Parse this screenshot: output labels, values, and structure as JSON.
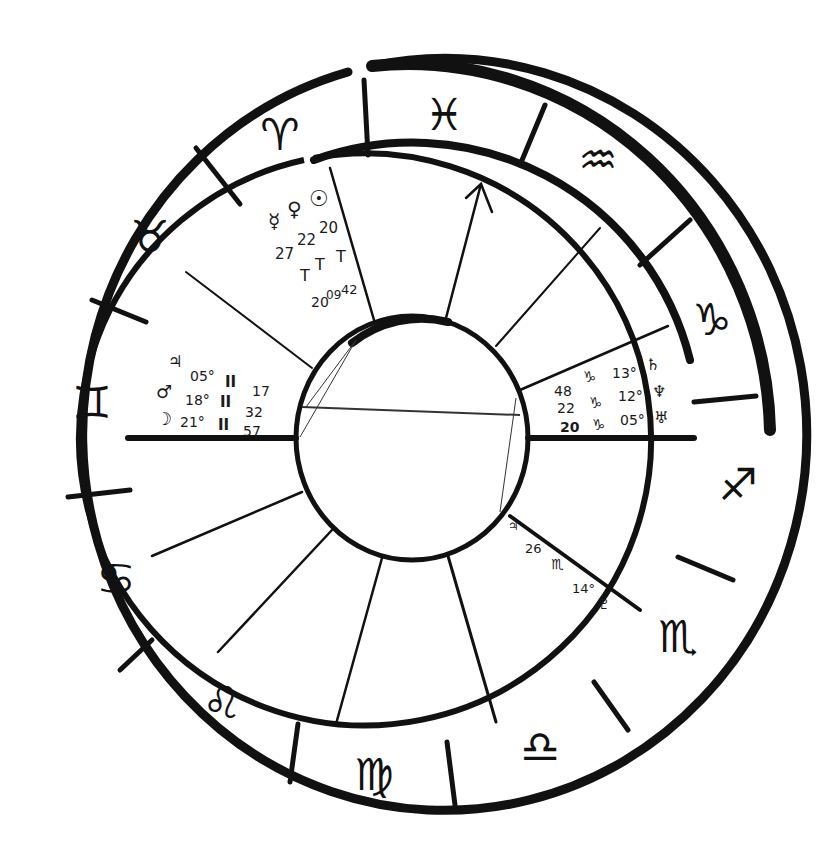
{
  "chart": {
    "type": "natal-chart-wheel",
    "style": "hand-drawn",
    "colors": {
      "ink": "#111111",
      "background": "#ffffff"
    }
  },
  "signs": [
    {
      "name": "pisces",
      "glyph": "♓",
      "x": 444,
      "y": 120,
      "rot": -2
    },
    {
      "name": "aquarius",
      "glyph": "♒",
      "x": 598,
      "y": 165,
      "rot": 25
    },
    {
      "name": "capricorn",
      "glyph": "♑",
      "x": 712,
      "y": 322,
      "rot": 50
    },
    {
      "name": "sagittarius",
      "glyph": "♐",
      "x": 736,
      "y": 490,
      "rot": 0
    },
    {
      "name": "scorpio",
      "glyph": "♏",
      "x": 680,
      "y": 640,
      "rot": -35
    },
    {
      "name": "libra",
      "glyph": "♎",
      "x": 540,
      "y": 752,
      "rot": -10
    },
    {
      "name": "virgo",
      "glyph": "♍",
      "x": 374,
      "y": 776,
      "rot": 0
    },
    {
      "name": "leo",
      "glyph": "♌",
      "x": 222,
      "y": 708,
      "rot": 25
    },
    {
      "name": "cancer",
      "glyph": "♋",
      "x": 116,
      "y": 580,
      "rot": 65
    },
    {
      "name": "gemini",
      "glyph": "♊",
      "x": 90,
      "y": 400,
      "rot": 90
    },
    {
      "name": "taurus",
      "glyph": "♉",
      "x": 150,
      "y": 240,
      "rot": -30
    },
    {
      "name": "aries",
      "glyph": "♈",
      "x": 280,
      "y": 140,
      "rot": -15
    }
  ],
  "planets": {
    "upper_group": {
      "mercury": {
        "glyph": "☿",
        "degree": "27°",
        "sign": "♈",
        "minutes": "20"
      },
      "venus": {
        "glyph": "♀",
        "degree": "22°",
        "sign": "♈",
        "minutes": "09"
      },
      "sun": {
        "glyph": "☉",
        "degree": "20°",
        "sign": "♈",
        "minutes": "42"
      },
      "minutes_label": "20⁰⁹⁴²"
    },
    "left_group": [
      {
        "name": "jupiter",
        "glyph": "♃",
        "degree": "05°",
        "sign": "♊",
        "minutes": "17"
      },
      {
        "name": "mars",
        "glyph": "♂",
        "degree": "18°",
        "sign": "♊",
        "minutes": "32"
      },
      {
        "name": "moon",
        "glyph": "☽",
        "degree": "21°",
        "sign": "♊",
        "minutes": "57"
      }
    ],
    "right_group": [
      {
        "name": "saturn",
        "glyph": "♄",
        "degree": "13°",
        "sign": "♑",
        "minutes": "48"
      },
      {
        "name": "neptune",
        "glyph": "♆",
        "degree": "12°",
        "sign": "♑",
        "minutes": "22"
      },
      {
        "name": "uranus",
        "glyph": "♅",
        "degree": "05°",
        "sign": "♑",
        "minutes": "20"
      }
    ],
    "lower_right": {
      "name": "pluto",
      "glyph": "♇",
      "degree": "14°",
      "sign": "♏",
      "minutes": "26",
      "marker": "♃"
    }
  },
  "labels": {
    "upper": {
      "mercury_glyph": "☿",
      "venus_glyph": "♀",
      "sun_glyph": "☉",
      "deg_mercury": "27",
      "deg_venus": "22",
      "deg_sun": "20",
      "aries_1": "T",
      "aries_2": "T",
      "aries_3": "T",
      "min_1": "20",
      "min_2": "09",
      "min_3": "42"
    },
    "left": {
      "jupiter_glyph": "♃",
      "mars_glyph": "♂",
      "moon_glyph": "☽",
      "deg_1": "05°",
      "deg_2": "18°",
      "deg_3": "21°",
      "sign_1": "II",
      "sign_2": "II",
      "sign_3": "II",
      "min_1": "17",
      "min_2": "32",
      "min_3": "57"
    },
    "right": {
      "saturn_glyph": "♄",
      "neptune_glyph": "♆",
      "uranus_glyph": "♅",
      "deg_1": "13°",
      "deg_2": "12°",
      "deg_3": "05°",
      "sign_glyph": "♑",
      "min_1": "48",
      "min_2": "22",
      "min_3": "20"
    },
    "lower_right": {
      "marker": "♃",
      "minutes": "26",
      "sign": "♏",
      "degree": "14°",
      "pluto_glyph": "♇"
    }
  }
}
